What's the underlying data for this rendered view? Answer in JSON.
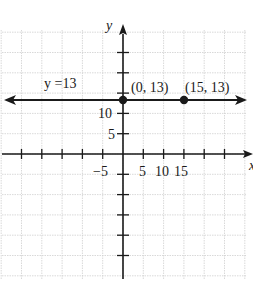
{
  "chart_data": {
    "type": "line",
    "title": "",
    "xlabel": "x",
    "ylabel": "y",
    "xlim": [
      -30,
      30
    ],
    "ylim": [
      -30,
      30
    ],
    "grid": true,
    "x_ticks_step": 5,
    "y_ticks_step": 5,
    "x_tick_labels": [
      {
        "value": -5,
        "label": "−5"
      },
      {
        "value": 5,
        "label": "5"
      },
      {
        "value": 10,
        "label": "10"
      },
      {
        "value": 15,
        "label": "15"
      }
    ],
    "y_tick_labels": [
      {
        "value": 5,
        "label": "5"
      },
      {
        "value": 10,
        "label": "10"
      }
    ],
    "series": [
      {
        "name": "y =13",
        "equation": "y = 13",
        "kind": "horizontal-line",
        "y": 13,
        "arrows": "both",
        "color": "#1a1a1a"
      }
    ],
    "points": [
      {
        "x": 0,
        "y": 13,
        "label": "(0, 13)"
      },
      {
        "x": 15,
        "y": 13,
        "label": "(15, 13)"
      }
    ],
    "annotations": [
      {
        "text": "y =13",
        "near": "line-left"
      }
    ]
  },
  "labels": {
    "x_axis": "x",
    "y_axis": "y",
    "line_label": "y =13",
    "point1": "(0, 13)",
    "point2": "(15, 13)",
    "tick_neg5": "−5",
    "tick_5": "5",
    "tick_10x": "10",
    "tick_15": "15",
    "tick_10y": "10",
    "tick_5y": "5"
  },
  "colors": {
    "grid": "#c8c8c8",
    "axis": "#1a1a1a",
    "line": "#1a1a1a"
  }
}
